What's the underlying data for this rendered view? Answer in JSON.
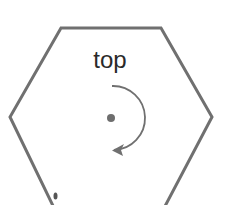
{
  "diagram": {
    "label": "top",
    "shape": "hexagon",
    "rotation_direction": "clockwise",
    "colors": {
      "outline": "#707070",
      "text": "#2a2a2a",
      "dot": "#6e6e6e",
      "arrow": "#707070",
      "background": "#ffffff"
    }
  }
}
